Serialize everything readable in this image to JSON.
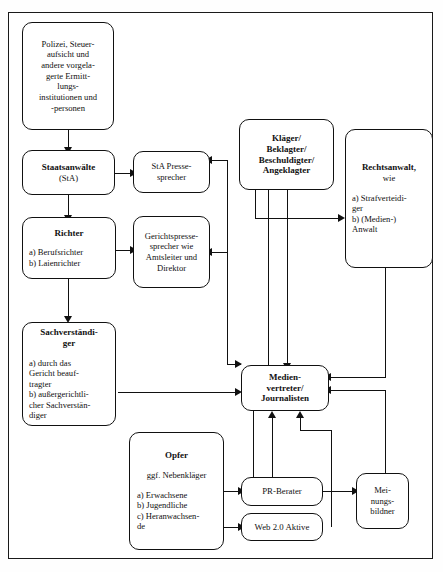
{
  "diagram": {
    "frame_color": "#1a1a1a",
    "nodes": {
      "polizei": {
        "title": "Polizei, Steuer-\naufsicht und\nandere vorgela-\ngerte Ermitt-\nlungs-\ninstitutionen und\n-personen"
      },
      "staatsanwaelte": {
        "title": "Staatsanwälte",
        "sub": "(StA)"
      },
      "sta_presse": {
        "title": "StA Presse-\nsprecher"
      },
      "richter": {
        "title": "Richter",
        "items": "a) Berufsrichter\nb) Laienrichter"
      },
      "gerichtspresse": {
        "title": "Gerichtspresse-\nsprecher wie\nAmtsleiter und\nDirektor"
      },
      "sachverstaendiger": {
        "title": "Sachverständi-\nger",
        "items": "a) durch das\nGericht beauf-\ntragter\nb) außergerichtli-\ncher Sachverstän-\ndiger"
      },
      "klaeger": {
        "title": "Kläger/\nBeklagter/\nBeschuldigter/\nAngeklagter"
      },
      "rechtsanwalt": {
        "title": "Rechtsanwalt,",
        "sub": "wie",
        "items": "a) Strafverteidi-\nger\nb) (Medien-)\nAnwalt"
      },
      "medien": {
        "title": "Medien-\nvertreter/\nJournalisten"
      },
      "opfer": {
        "title": "Opfer",
        "sub": "ggf. Nebenkläger",
        "items": "a) Erwachsene\nb) Jugendliche\nc) Heranwachsen-\nde"
      },
      "pr_berater": {
        "title": "PR-Berater"
      },
      "web20": {
        "title": "Web 2.0 Aktive"
      },
      "meinungsbildner": {
        "title": "Mei-\nnungs-\nbildner"
      }
    }
  }
}
